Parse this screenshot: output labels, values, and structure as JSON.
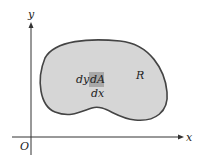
{
  "diagram": {
    "axes": {
      "x_label": "x",
      "y_label": "y",
      "origin_label": "O"
    },
    "region": {
      "label": "R",
      "fill_color": "#d6d6d6",
      "stroke_color": "#444444"
    },
    "element": {
      "label": "dA",
      "width_label": "dx",
      "height_label": "dy",
      "fill_color": "#a8a8a8"
    }
  }
}
